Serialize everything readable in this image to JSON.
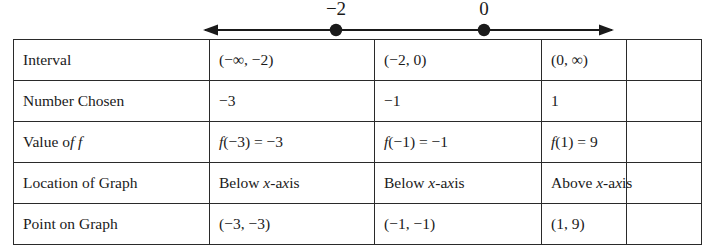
{
  "number_line": {
    "name": "number-line",
    "marks": [
      {
        "label": "−2",
        "x": 336
      },
      {
        "label": "0",
        "x": 484
      }
    ],
    "left_arrow": {
      "tip_x": 205,
      "y": 30
    },
    "right_arrow": {
      "tip_x": 612,
      "y": 30
    },
    "line_color": "#1a1a1a"
  },
  "table": {
    "row_labels": [
      "Interval",
      "Number Chosen",
      "Value of f",
      "Location of Graph",
      "Point on Graph"
    ],
    "rows": [
      {
        "label": "Interval",
        "cells": [
          "(−∞, −2)",
          "(−2, 0)",
          "(0, ∞)"
        ]
      },
      {
        "label": "Number Chosen",
        "cells": [
          "−3",
          "−1",
          "1"
        ]
      },
      {
        "label": "Value of f",
        "cells": [
          "f(−3) = −3",
          "f(−1) = −1",
          "f(1) = 9"
        ]
      },
      {
        "label": "Location of Graph",
        "cells": [
          "Below x-axis",
          "Below x-axis",
          "Above x-axis"
        ]
      },
      {
        "label": "Point on Graph",
        "cells": [
          "(−3, −3)",
          "(−1, −1)",
          "(1, 9)"
        ]
      }
    ]
  },
  "colors": {
    "border": "#2a2a2a",
    "text": "#1a1a1a",
    "background": "#ffffff"
  }
}
